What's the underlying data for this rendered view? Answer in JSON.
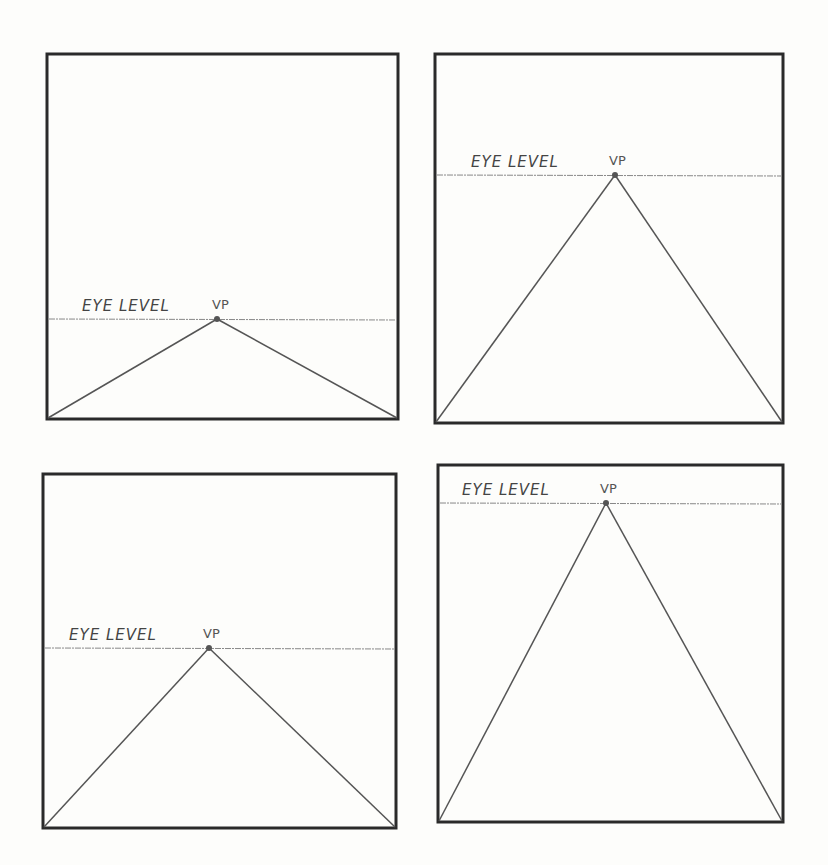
{
  "panels": [
    {
      "id": 1,
      "eye_level_label": "EYE LEVEL",
      "vp_label": "VP",
      "box": [
        47,
        54,
        398,
        419
      ],
      "horizon_y": 319,
      "vp_x": 217,
      "label_x": 82,
      "vpl_x": 212
    },
    {
      "id": 2,
      "eye_level_label": "EYE LEVEL",
      "vp_label": "VP",
      "box": [
        435,
        54,
        783,
        423
      ],
      "horizon_y": 175,
      "vp_x": 615,
      "label_x": 471,
      "vpl_x": 609
    },
    {
      "id": 3,
      "eye_level_label": "EYE LEVEL",
      "vp_label": "VP",
      "box": [
        43,
        474,
        396,
        828
      ],
      "horizon_y": 648,
      "vp_x": 209,
      "label_x": 69,
      "vpl_x": 203
    },
    {
      "id": 4,
      "eye_level_label": "EYE LEVEL",
      "vp_label": "VP",
      "box": [
        438,
        465,
        783,
        822
      ],
      "horizon_y": 503,
      "vp_x": 606,
      "label_x": 462,
      "vpl_x": 600
    }
  ],
  "colors": {
    "frame": "#2a2a2a",
    "line": "#555555",
    "horizon": "#888888",
    "vp_dot": "#555555"
  }
}
